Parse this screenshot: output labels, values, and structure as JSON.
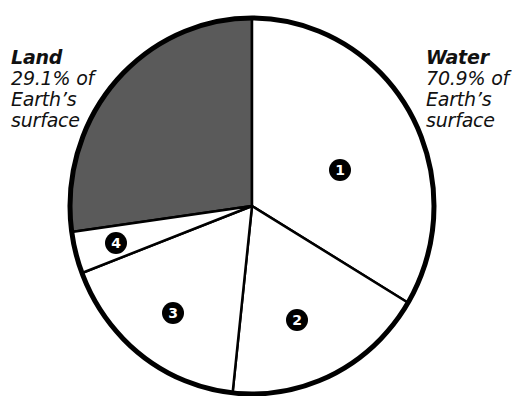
{
  "chart_data": {
    "type": "pie",
    "title": "",
    "categories": [
      "Land",
      "1",
      "2",
      "3",
      "4"
    ],
    "values": [
      27.2,
      33.6,
      18.1,
      17.5,
      3.6
    ],
    "annotations": [
      {
        "label": "Land",
        "text": "29.1% of Earth's surface"
      },
      {
        "label": "Water",
        "text": "70.9% of Earth's surface"
      }
    ],
    "colors": {
      "land": "#5a5a5a",
      "water": "#ffffff",
      "outline": "#000000"
    },
    "legend_position": "none",
    "geometry": {
      "cx": 252,
      "cy": 206,
      "rx": 182,
      "ry": 188
    }
  },
  "labels": {
    "land": {
      "title": "Land",
      "line1": "29.1% of",
      "line2": "Earth’s",
      "line3": "surface"
    },
    "water": {
      "title": "Water",
      "line1": "70.9% of",
      "line2": "Earth’s",
      "line3": "surface"
    }
  },
  "markers": [
    {
      "id": "1",
      "x": 340,
      "y": 170
    },
    {
      "id": "2",
      "x": 297,
      "y": 320
    },
    {
      "id": "3",
      "x": 173,
      "y": 313
    },
    {
      "id": "4",
      "x": 116,
      "y": 243
    }
  ]
}
